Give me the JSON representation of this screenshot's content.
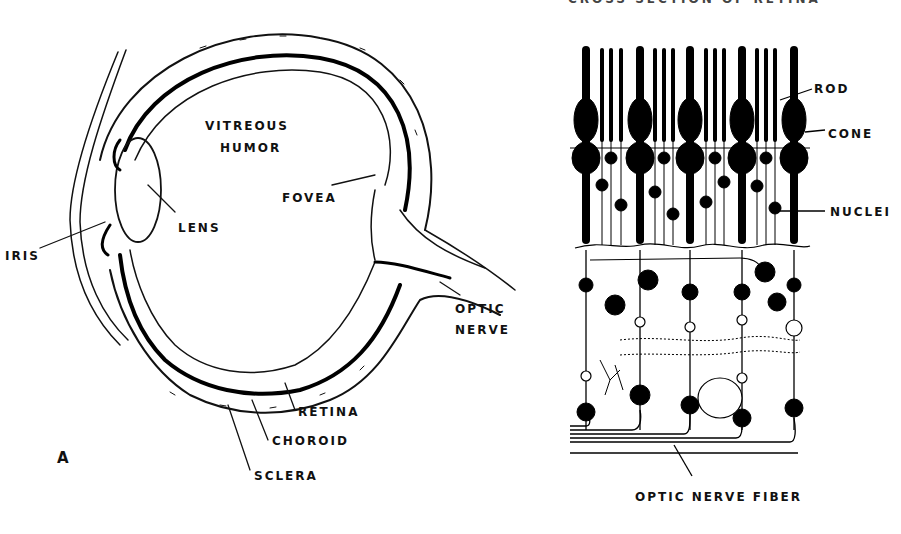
{
  "figure": {
    "cropped_title": "CROSS SECTION OF RETINA",
    "panel_a": {
      "letter": "A",
      "labels": {
        "vitreous_1": "VITREOUS",
        "vitreous_2": "HUMOR",
        "lens": "LENS",
        "iris": "IRIS",
        "fovea": "FOVEA",
        "optic_1": "OPTIC",
        "optic_2": "NERVE",
        "retina": "RETINA",
        "choroid": "CHOROID",
        "sclera": "SCLERA"
      }
    },
    "panel_b": {
      "labels": {
        "rod": "ROD",
        "cone": "CONE",
        "nuclei": "NUCLEI",
        "optic_nerve_fiber": "OPTIC NERVE FIBER"
      }
    }
  }
}
